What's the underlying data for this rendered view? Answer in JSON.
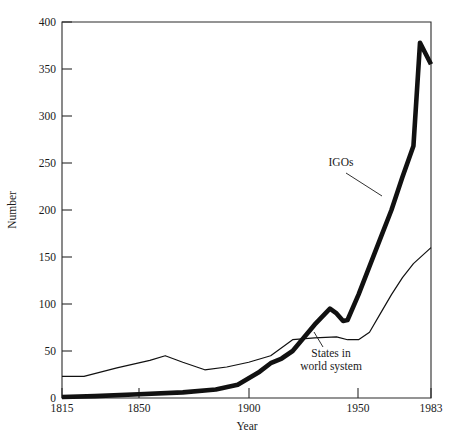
{
  "chart_data": {
    "type": "line",
    "title": "",
    "xlabel": "Year",
    "ylabel": "Number",
    "xlim": [
      1815,
      1983
    ],
    "ylim": [
      0,
      400
    ],
    "grid": false,
    "legend_position": "inline-annotations",
    "xticks": [
      1815,
      1850,
      1900,
      1950,
      1983
    ],
    "xticklabels": [
      "1815",
      "1850",
      "1900",
      "1950",
      "1983"
    ],
    "yticks": [
      0,
      50,
      100,
      150,
      200,
      250,
      300,
      350,
      400
    ],
    "yticklabels": [
      "0",
      "50",
      "100",
      "150",
      "200",
      "250",
      "300",
      "350",
      "400"
    ],
    "series": [
      {
        "name": "IGOs",
        "style": "thick",
        "x": [
          1815,
          1830,
          1850,
          1870,
          1885,
          1895,
          1905,
          1910,
          1915,
          1920,
          1930,
          1937,
          1940,
          1943,
          1945,
          1950,
          1955,
          1960,
          1965,
          1970,
          1975,
          1978,
          1983
        ],
        "values": [
          1,
          2,
          4,
          6,
          9,
          14,
          28,
          37,
          42,
          50,
          78,
          95,
          90,
          82,
          83,
          110,
          140,
          170,
          200,
          235,
          268,
          378,
          355
        ]
      },
      {
        "name": "States in world system",
        "style": "thin",
        "x": [
          1815,
          1825,
          1840,
          1855,
          1862,
          1870,
          1880,
          1890,
          1900,
          1910,
          1920,
          1930,
          1940,
          1945,
          1950,
          1955,
          1960,
          1965,
          1970,
          1975,
          1983
        ],
        "values": [
          23,
          23,
          32,
          40,
          45,
          38,
          30,
          33,
          38,
          45,
          62,
          64,
          65,
          62,
          62,
          70,
          90,
          110,
          128,
          143,
          160
        ]
      }
    ],
    "annotations": [
      {
        "name": "igos-label",
        "text": "IGOs",
        "lines": [
          "IGOs"
        ],
        "series": "IGOs"
      },
      {
        "name": "states-label",
        "text": "States in world system",
        "lines": [
          "States in",
          "world system"
        ],
        "series": "States in world system"
      }
    ]
  }
}
